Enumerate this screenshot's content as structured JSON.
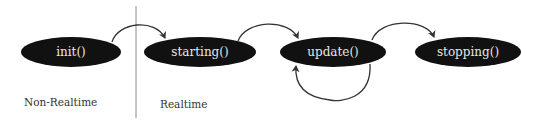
{
  "diagram": {
    "type": "state-lifecycle",
    "colors": {
      "node_fill": "#111111",
      "node_text": "#e8e8e8",
      "edge": "#333333",
      "divider": "#8a8a8a",
      "label": "#333333",
      "background": "#ffffff"
    },
    "regions": [
      {
        "id": "non-realtime",
        "label": "Non-Realtime"
      },
      {
        "id": "realtime",
        "label": "Realtime"
      }
    ],
    "nodes": [
      {
        "id": "init",
        "label": "init()"
      },
      {
        "id": "starting",
        "label": "starting()"
      },
      {
        "id": "update",
        "label": "update()"
      },
      {
        "id": "stopping",
        "label": "stopping()"
      }
    ],
    "edges": [
      {
        "from": "init",
        "to": "starting"
      },
      {
        "from": "starting",
        "to": "update"
      },
      {
        "from": "update",
        "to": "stopping"
      },
      {
        "from": "update",
        "to": "update",
        "kind": "self-loop"
      }
    ]
  }
}
